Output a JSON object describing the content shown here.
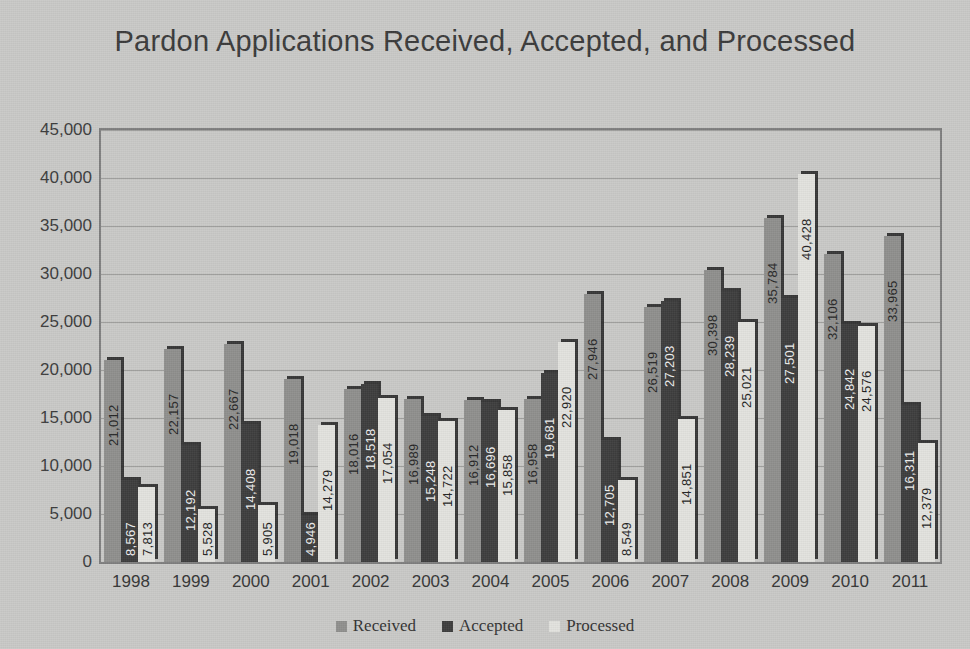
{
  "chart_data": {
    "type": "bar",
    "title": "Pardon Applications Received, Accepted, and Processed",
    "xlabel": "",
    "ylabel": "",
    "ylim": [
      0,
      45000
    ],
    "ytick_step": 5000,
    "yticks": [
      "0",
      "5,000",
      "10,000",
      "15,000",
      "20,000",
      "25,000",
      "30,000",
      "35,000",
      "40,000",
      "45,000"
    ],
    "grid": true,
    "legend_position": "bottom",
    "categories": [
      "1998",
      "1999",
      "2000",
      "2001",
      "2002",
      "2003",
      "2004",
      "2005",
      "2006",
      "2007",
      "2008",
      "2009",
      "2010",
      "2011"
    ],
    "series": [
      {
        "name": "Received",
        "color": "#8f8f8d",
        "values": [
          21012,
          22157,
          22667,
          19018,
          18016,
          16989,
          16912,
          16958,
          27946,
          26519,
          30398,
          35784,
          32106,
          33965
        ],
        "labels": [
          "21,012",
          "22,157",
          "22,667",
          "19,018",
          "18,016",
          "16,989",
          "16,912",
          "16,958",
          "27,946",
          "26,519",
          "30,398",
          "35,784",
          "32,106",
          "33,965"
        ]
      },
      {
        "name": "Accepted",
        "color": "#3d3d3d",
        "values": [
          8567,
          12192,
          14408,
          4946,
          18518,
          15248,
          16696,
          19681,
          12705,
          27203,
          28239,
          27501,
          24842,
          16311
        ],
        "labels": [
          "8,567",
          "12,192",
          "14,408",
          "4,946",
          "18,518",
          "15,248",
          "16,696",
          "19,681",
          "12,705",
          "27,203",
          "28,239",
          "27,501",
          "24,842",
          "16,311"
        ]
      },
      {
        "name": "Processed",
        "color": "#e2e2de",
        "values": [
          7813,
          5528,
          5905,
          14279,
          17054,
          14722,
          15858,
          22920,
          8549,
          14851,
          25021,
          40428,
          24576,
          12379
        ],
        "labels": [
          "7,813",
          "5,528",
          "5,905",
          "14,279",
          "17,054",
          "14,722",
          "15,858",
          "22,920",
          "8,549",
          "14,851",
          "25,021",
          "40,428",
          "24,576",
          "12,379"
        ]
      }
    ]
  },
  "colors": {
    "background": "#c9c9c7",
    "plot_border": "#7e7e7e",
    "gridline": "#9c9c9a",
    "title_text": "#3a3a3a",
    "axis_text": "#353535"
  }
}
